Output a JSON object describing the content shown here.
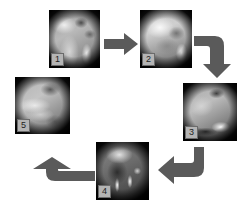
{
  "figure": {
    "type": "cycle-diagram",
    "background_color": "#ffffff",
    "arrow_color": "#5a5a5a",
    "panel_count": 5,
    "label_box_color": "#b4b4b4",
    "label_border_color": "#6b6b6b",
    "label_text_color": "#1e1e1e"
  },
  "panels": [
    {
      "id": "panel-1",
      "label": "1",
      "description": "grayscale endoscopic view, bright mucosal fold upper left with dark patches upper right",
      "x": 49,
      "y": 10,
      "w": 51,
      "h": 58
    },
    {
      "id": "panel-2",
      "label": "2",
      "description": "grayscale endoscopic view, broad bright region with bright highlight at lower right",
      "x": 140,
      "y": 10,
      "w": 52,
      "h": 58
    },
    {
      "id": "panel-3",
      "label": "3",
      "description": "grayscale endoscopic view, dark spot upper right and bright instrument at lower right",
      "x": 183,
      "y": 83,
      "w": 54,
      "h": 58
    },
    {
      "id": "panel-4",
      "label": "4",
      "description": "dark grayscale endoscopic view with two bright vertical instrument prongs",
      "x": 96,
      "y": 142,
      "w": 53,
      "h": 58
    },
    {
      "id": "panel-5",
      "label": "5",
      "description": "grayscale endoscopic view, diagonal bright mucosal folds with dark area upper right",
      "x": 15,
      "y": 77,
      "w": 55,
      "h": 57
    }
  ],
  "arrows": [
    {
      "id": "arrow-1-to-2",
      "from": "panel-1",
      "to": "panel-2",
      "shape": "straight",
      "direction": "right"
    },
    {
      "id": "arrow-2-to-3",
      "from": "panel-2",
      "to": "panel-3",
      "shape": "elbow",
      "direction": "right-then-down"
    },
    {
      "id": "arrow-3-to-4",
      "from": "panel-3",
      "to": "panel-4",
      "shape": "elbow",
      "direction": "down-then-left"
    },
    {
      "id": "arrow-4-to-5",
      "from": "panel-4",
      "to": "panel-5",
      "shape": "elbow",
      "direction": "left-then-up"
    }
  ]
}
